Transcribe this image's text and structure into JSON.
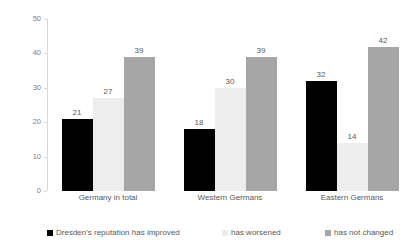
{
  "chart_data": {
    "type": "bar",
    "title": "",
    "subtitle": "",
    "xlabel": "",
    "ylabel": "",
    "ylim": [
      0,
      50
    ],
    "yticks": [
      0,
      10,
      20,
      30,
      40,
      50
    ],
    "grid": false,
    "legend_position": "bottom",
    "categories": [
      "Germany in total",
      "Western Germans",
      "Eastern Germans"
    ],
    "series": [
      {
        "name": "Dresden's reputation has improved",
        "color": "#000000",
        "values": [
          21,
          18,
          32
        ]
      },
      {
        "name": "has worsened",
        "color": "#ededed",
        "values": [
          27,
          30,
          14
        ]
      },
      {
        "name": "has not changed",
        "color": "#a6a6a6",
        "values": [
          39,
          39,
          42
        ]
      }
    ],
    "data_labels": [
      [
        "21",
        "27",
        "39"
      ],
      [
        "18",
        "30",
        "39"
      ],
      [
        "32",
        "14",
        "42"
      ]
    ],
    "ytick_labels": [
      "0",
      "10",
      "20",
      "30",
      "40",
      "50"
    ]
  },
  "axis": {
    "y": {
      "t0": "0",
      "t1": "10",
      "t2": "20",
      "t3": "30",
      "t4": "40",
      "t5": "50"
    }
  },
  "groups": [
    {
      "label": "Germany in total",
      "v0": "21",
      "v1": "27",
      "v2": "39"
    },
    {
      "label": "Western Germans",
      "v0": "18",
      "v1": "30",
      "v2": "39"
    },
    {
      "label": "Eastern Germans",
      "v0": "32",
      "v1": "14",
      "v2": "42"
    }
  ],
  "legend": {
    "items": [
      {
        "label": "Dresden's reputation has improved",
        "color": "#000000"
      },
      {
        "label": "has worsened",
        "color": "#ededed"
      },
      {
        "label": "has not changed",
        "color": "#a6a6a6"
      }
    ]
  }
}
